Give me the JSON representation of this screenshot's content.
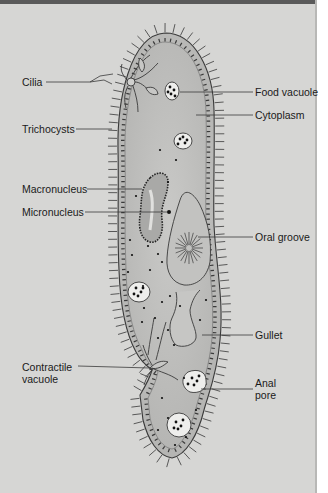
{
  "diagram": {
    "colors": {
      "panel_background": "#d6d6d4",
      "top_bar": "#5a5a5a",
      "cell_body": "#b9b9b7",
      "cell_outline": "#3a3a3a",
      "label_text": "#1a1a1a",
      "leader_line": "#3a3a3a"
    },
    "labels_left": [
      {
        "id": "cilia",
        "text": "Cilia"
      },
      {
        "id": "trichocysts",
        "text": "Trichocysts"
      },
      {
        "id": "macronucleus",
        "text": "Macronucleus"
      },
      {
        "id": "micronucleus",
        "text": "Micronucleus"
      },
      {
        "id": "contractile_vacuole",
        "line1": "Contractile",
        "line2": "vacuole"
      }
    ],
    "labels_right": [
      {
        "id": "food_vacuole",
        "text": "Food vacuole"
      },
      {
        "id": "cytoplasm",
        "text": "Cytoplasm"
      },
      {
        "id": "oral_groove",
        "text": "Oral groove"
      },
      {
        "id": "gullet",
        "text": "Gullet"
      },
      {
        "id": "anal_pore",
        "line1": "Anal",
        "line2": "pore"
      }
    ]
  }
}
